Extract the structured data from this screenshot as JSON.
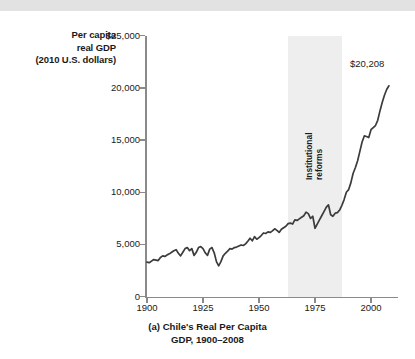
{
  "figure": {
    "caption_line1": "(a) Chile's Real Per Capita",
    "caption_line2": "GDP, 1900–2008",
    "axis_color": "#8a8a8a",
    "line_color": "#3c3c3c",
    "band_color": "#eeeeee",
    "top_band_color": "#e2e2e2"
  },
  "annotations": {
    "reform_line1": "Institutional",
    "reform_line2": "reforms",
    "endpoint_label": "$20,208"
  },
  "chart_data": {
    "type": "line",
    "title": "(a) Chile's Real Per Capita GDP, 1900–2008",
    "ylabel_line1": "Per capita",
    "ylabel_line2": "real GDP",
    "ylabel_line3": "(2010 U.S. dollars)",
    "xlabel": "",
    "xlim": [
      1900,
      2008
    ],
    "ylim": [
      0,
      25000
    ],
    "grid": false,
    "legend": "none",
    "xticks": [
      1900,
      1925,
      1950,
      1975,
      2000
    ],
    "xtick_labels": [
      "1900",
      "1925",
      "1950",
      "1975",
      "2000"
    ],
    "yticks": [
      0,
      5000,
      10000,
      15000,
      20000,
      25000
    ],
    "ytick_labels": [
      "0",
      "5,000",
      "10,000",
      "15,000",
      "20,000",
      "$25,000"
    ],
    "shaded_region": {
      "label": "Institutional reforms",
      "x_start": 1963,
      "x_end": 1987
    },
    "annotation_points": [
      {
        "x": 2008,
        "y": 20208,
        "label": "$20,208"
      }
    ],
    "series": [
      {
        "name": "Chile real GDP per capita (2010 US$)",
        "x": [
          1900,
          1901,
          1902,
          1903,
          1904,
          1905,
          1906,
          1907,
          1908,
          1909,
          1910,
          1911,
          1912,
          1913,
          1914,
          1915,
          1916,
          1917,
          1918,
          1919,
          1920,
          1921,
          1922,
          1923,
          1924,
          1925,
          1926,
          1927,
          1928,
          1929,
          1930,
          1931,
          1932,
          1933,
          1934,
          1935,
          1936,
          1937,
          1938,
          1939,
          1940,
          1941,
          1942,
          1943,
          1944,
          1945,
          1946,
          1947,
          1948,
          1949,
          1950,
          1951,
          1952,
          1953,
          1954,
          1955,
          1956,
          1957,
          1958,
          1959,
          1960,
          1961,
          1962,
          1963,
          1964,
          1965,
          1966,
          1967,
          1968,
          1969,
          1970,
          1971,
          1972,
          1973,
          1974,
          1975,
          1976,
          1977,
          1978,
          1979,
          1980,
          1981,
          1982,
          1983,
          1984,
          1985,
          1986,
          1987,
          1988,
          1989,
          1990,
          1991,
          1992,
          1993,
          1994,
          1995,
          1996,
          1997,
          1998,
          1999,
          2000,
          2001,
          2002,
          2003,
          2004,
          2005,
          2006,
          2007,
          2008
        ],
        "y": [
          3300,
          3250,
          3400,
          3550,
          3500,
          3450,
          3750,
          3900,
          3850,
          4000,
          4100,
          4250,
          4400,
          4500,
          4150,
          3900,
          4250,
          4600,
          4700,
          4400,
          4600,
          3950,
          4250,
          4700,
          4800,
          4600,
          4200,
          3950,
          4550,
          4700,
          4200,
          3350,
          2950,
          3350,
          3900,
          4150,
          4350,
          4600,
          4550,
          4700,
          4750,
          4850,
          4950,
          4900,
          5050,
          5300,
          5600,
          5350,
          5750,
          5500,
          5650,
          5850,
          6100,
          6050,
          6200,
          6150,
          6300,
          6500,
          6350,
          6150,
          6450,
          6600,
          6750,
          7000,
          7050,
          6950,
          7350,
          7300,
          7450,
          7600,
          7750,
          8100,
          7950,
          7500,
          7700,
          6550,
          6950,
          7350,
          7750,
          8150,
          8550,
          8800,
          7850,
          7700,
          8000,
          8050,
          8300,
          8750,
          9300,
          10000,
          10250,
          10900,
          11800,
          12350,
          13000,
          13900,
          14800,
          15400,
          15350,
          15250,
          16000,
          16200,
          16400,
          16900,
          17800,
          18600,
          19300,
          19850,
          20208
        ]
      }
    ]
  }
}
